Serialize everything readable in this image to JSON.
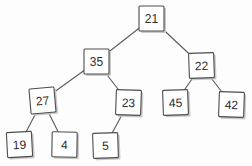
{
  "diagram": {
    "type": "binary-tree",
    "node_size": 25,
    "colors": {
      "background": "#fdfdfd",
      "node_fill": "#ffffff",
      "node_border": "#4d4d4d",
      "node_shadow": "#c9c9c9",
      "edge": "#5a5a5a",
      "text": "#2e2e2e"
    },
    "nodes": [
      {
        "value": "21",
        "x": 139,
        "y": 6,
        "tilt": 0
      },
      {
        "value": "35",
        "x": 84,
        "y": 49,
        "tilt": 0
      },
      {
        "value": "22",
        "x": 189,
        "y": 53,
        "tilt": -2
      },
      {
        "value": "27",
        "x": 30,
        "y": 88,
        "tilt": -5
      },
      {
        "value": "23",
        "x": 116,
        "y": 90,
        "tilt": 2
      },
      {
        "value": "45",
        "x": 163,
        "y": 90,
        "tilt": -2
      },
      {
        "value": "42",
        "x": 219,
        "y": 92,
        "tilt": 2
      },
      {
        "value": "19",
        "x": 7,
        "y": 132,
        "tilt": -3
      },
      {
        "value": "4",
        "x": 52,
        "y": 132,
        "tilt": 1
      },
      {
        "value": "5",
        "x": 93,
        "y": 133,
        "tilt": -2
      }
    ],
    "edges": [
      {
        "from": "21",
        "to": "35"
      },
      {
        "from": "21",
        "to": "22"
      },
      {
        "from": "35",
        "to": "27"
      },
      {
        "from": "35",
        "to": "23"
      },
      {
        "from": "22",
        "to": "45"
      },
      {
        "from": "22",
        "to": "42"
      },
      {
        "from": "27",
        "to": "19"
      },
      {
        "from": "27",
        "to": "4"
      },
      {
        "from": "23",
        "to": "5"
      }
    ]
  }
}
